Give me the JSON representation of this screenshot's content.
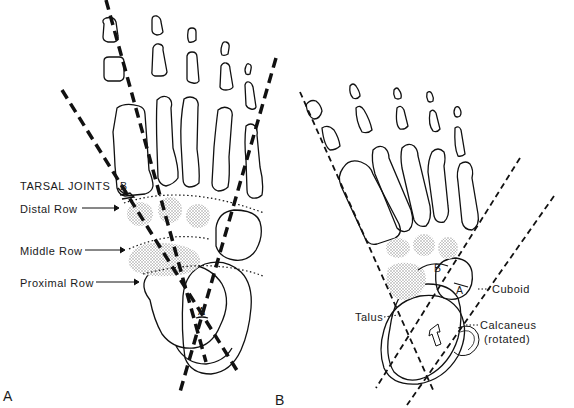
{
  "figure": {
    "panels": [
      {
        "id": "A",
        "label": "A"
      },
      {
        "id": "B",
        "label": "B"
      }
    ],
    "panel_a": {
      "heading": "TARSAL JOINTS",
      "rows": [
        "Distal Row",
        "Middle Row",
        "Proximal Row"
      ],
      "angle_labels": [
        "A",
        "B"
      ]
    },
    "panel_b": {
      "bones": {
        "cuboid": "Cuboid",
        "talus": "Talus",
        "calcaneus": "Calcaneus",
        "calcaneus_note": "(rotated)"
      },
      "angle_labels": [
        "A",
        "B"
      ]
    },
    "colors": {
      "line": "#111111",
      "stipple": "#b8b8b8",
      "background": "#ffffff"
    }
  }
}
